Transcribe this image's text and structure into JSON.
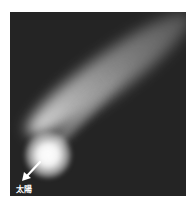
{
  "image": {
    "subject": "comet",
    "background_color": "#242424",
    "frame_color": "#ffffff"
  },
  "annotation": {
    "label": "太陽",
    "arrow_direction": "down-left",
    "arrow_color": "#ffffff"
  }
}
